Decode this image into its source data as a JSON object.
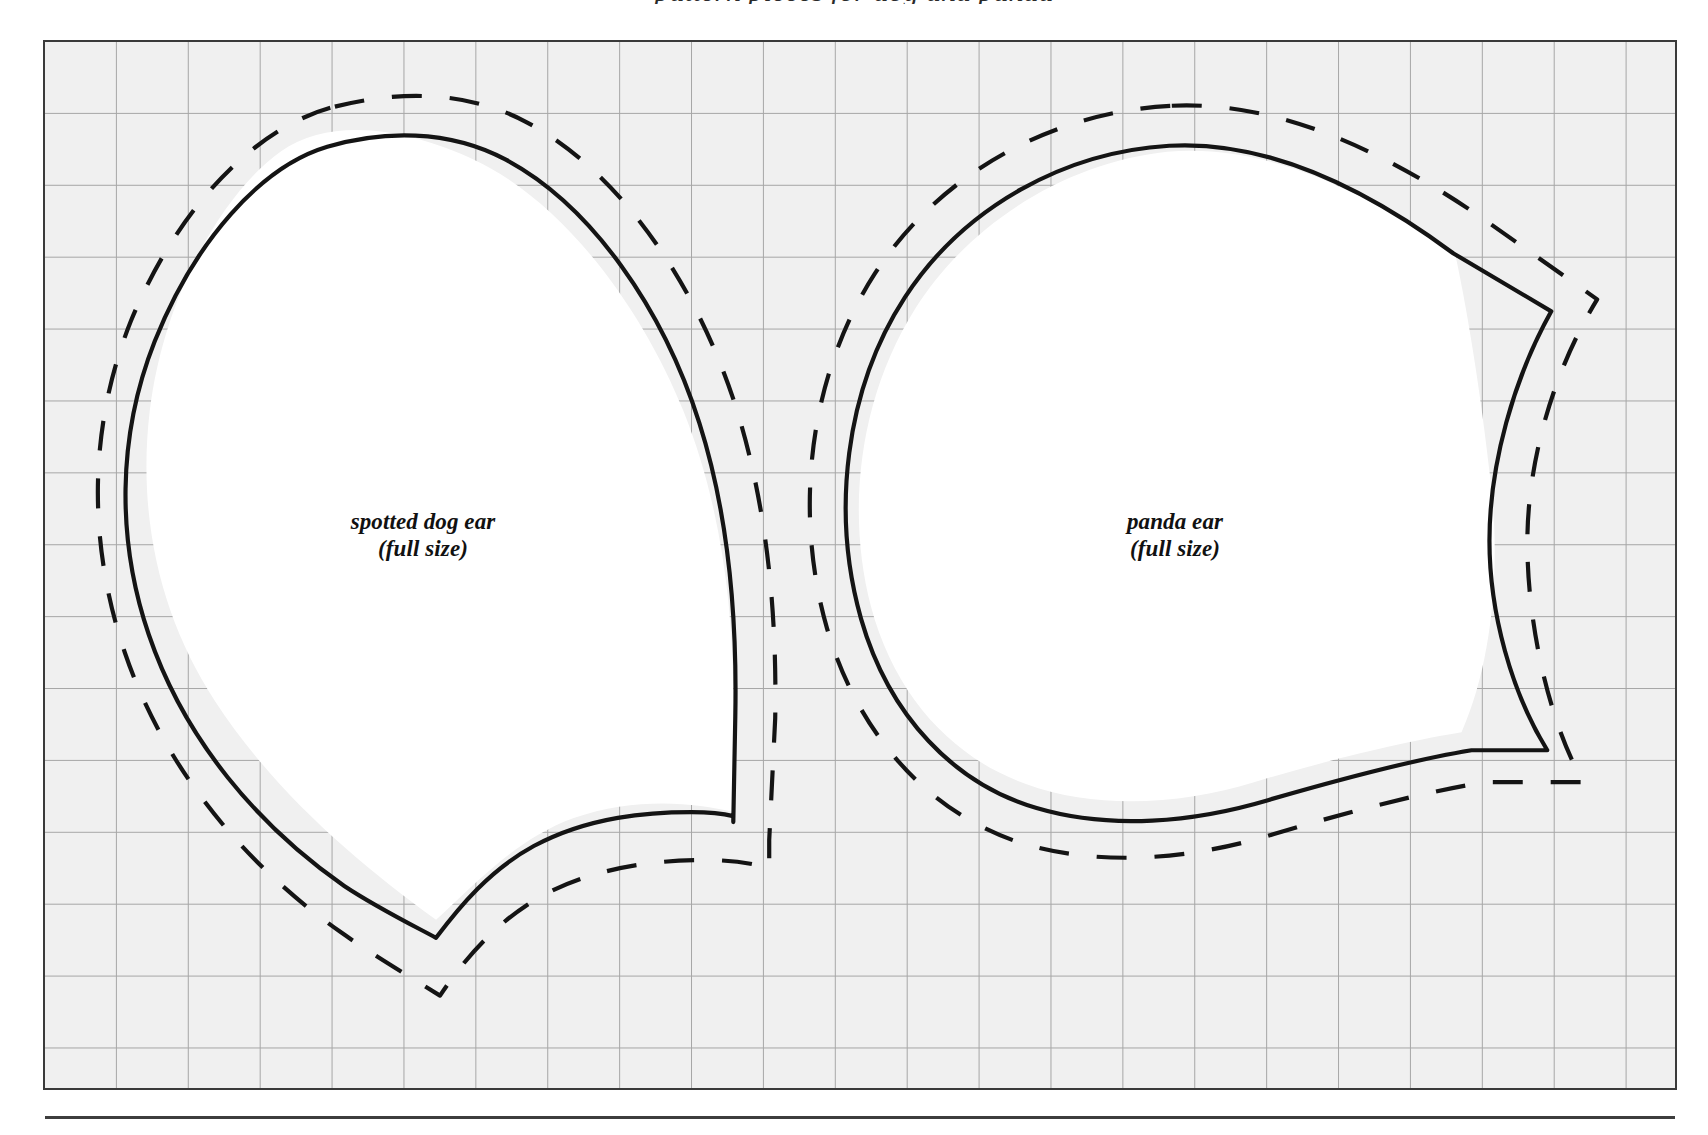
{
  "page": {
    "kind": "sewing-pattern-sheet",
    "background_color": "#ffffff",
    "panel_fill": "#f0f0f0",
    "grid_color": "#9a9a9a",
    "ink_color": "#141414",
    "border_color": "#3a3a3a",
    "title_cropped": "pattern pieces for dog and panda"
  },
  "panel": {
    "grid": {
      "cell_px": 72,
      "columns": 23,
      "rows": 15
    }
  },
  "pieces": [
    {
      "id": "spotted-dog-ear",
      "name": "spotted dog ear",
      "size_note": "(full size)",
      "label_line_1": "spotted dog ear",
      "label_line_2": "(full size)",
      "has_cut_line": true,
      "has_seam_line": true
    },
    {
      "id": "panda-ear",
      "name": "panda ear",
      "size_note": "(full size)",
      "label_line_1": "panda ear",
      "label_line_2": "(full size)",
      "has_cut_line": true,
      "has_seam_line": true
    }
  ],
  "legend": {
    "solid_meaning": "stitching / finished edge line",
    "dashed_meaning": "cutting line with seam allowance"
  }
}
